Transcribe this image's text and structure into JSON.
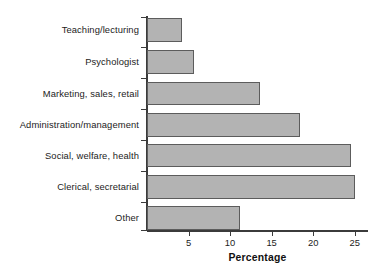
{
  "chart_data": {
    "type": "bar",
    "orientation": "horizontal",
    "title": "",
    "subtitle": "",
    "xlabel": "Percentage",
    "ylabel": "",
    "categories": [
      "Teaching/lecturing",
      "Psychologist",
      "Marketing, sales, retail",
      "Administration/management",
      "Social, welfare, health",
      "Clerical, secretarial",
      "Other"
    ],
    "values": [
      4.2,
      5.7,
      13.6,
      18.4,
      24.6,
      25.0,
      11.2
    ],
    "xlim": [
      0,
      26.6
    ],
    "xticks": [
      5,
      10,
      15,
      20,
      25
    ],
    "xtick_labels": [
      "5",
      "10",
      "15",
      "20",
      "25"
    ],
    "grid": false,
    "legend": null,
    "bar_fill": "#b3b3b3",
    "bar_edge": "#5c5c5c",
    "axis_color": "#3b3b3b",
    "background": "#ffffff"
  }
}
